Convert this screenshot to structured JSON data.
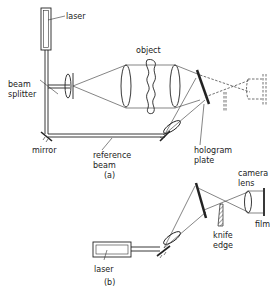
{
  "diagram": {
    "panel_a": {
      "caption": "(a)",
      "labels": {
        "laser": "laser",
        "beam_splitter_line1": "beam",
        "beam_splitter_line2": "splitter",
        "object": "object",
        "mirror": "mirror",
        "reference_beam_line1": "reference",
        "reference_beam_line2": "beam",
        "hologram_plate_line1": "hologram",
        "hologram_plate_line2": "plate"
      }
    },
    "panel_b": {
      "caption": "(b)",
      "labels": {
        "camera_lens_line1": "camera",
        "camera_lens_line2": "lens",
        "film": "film",
        "knife_edge_line1": "knife",
        "knife_edge_line2": "edge",
        "laser": "laser"
      }
    }
  }
}
